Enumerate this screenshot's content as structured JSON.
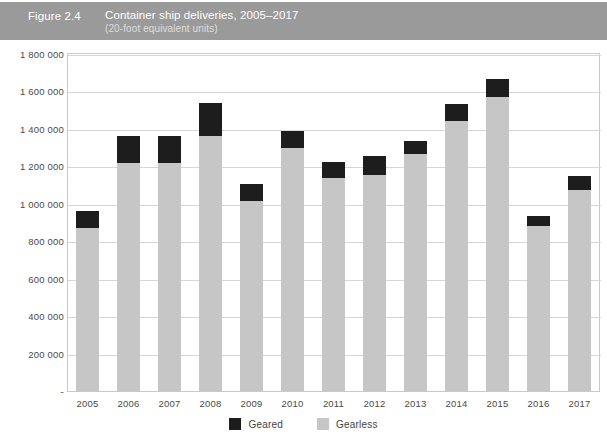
{
  "header": {
    "figure_number": "Figure 2.4",
    "title": "Container ship deliveries, 2005–2017",
    "subtitle": "(20-foot equivalent units)",
    "band_color": "#9a9a9a"
  },
  "legend": {
    "position": "bottom-center",
    "items": [
      {
        "label": "Geared",
        "color": "#1d1d1d",
        "swatch_name": "legend-swatch-geared"
      },
      {
        "label": "Gearless",
        "color": "#c6c6c6",
        "swatch_name": "legend-swatch-gearless"
      }
    ]
  },
  "axis": {
    "y_tick_labels": [
      "1 800 000",
      "1 600 000",
      "1 400 000",
      "1 200 000",
      "1 000 000",
      "800 000",
      "600 000",
      "400 000",
      "200 000",
      "-"
    ],
    "y_tick_values": [
      1800000,
      1600000,
      1400000,
      1200000,
      1000000,
      800000,
      600000,
      400000,
      200000,
      0
    ],
    "grid": true,
    "grid_color": "#d6d6d6",
    "frame_color": "#c9c9c9"
  },
  "chart_data": {
    "type": "bar",
    "stacked": true,
    "title": "Container ship deliveries, 2005–2017",
    "subtitle": "(20-foot equivalent units)",
    "xlabel": "",
    "ylabel": "",
    "ylim": [
      0,
      1800000
    ],
    "ytick_step": 200000,
    "grid": true,
    "legend_position": "bottom-center",
    "categories": [
      "2005",
      "2006",
      "2007",
      "2008",
      "2009",
      "2010",
      "2011",
      "2012",
      "2013",
      "2014",
      "2015",
      "2016",
      "2017"
    ],
    "series": [
      {
        "name": "Gearless",
        "color": "#c6c6c6",
        "values": [
          870000,
          1216000,
          1216000,
          1360000,
          1013000,
          1296000,
          1136000,
          1152000,
          1264000,
          1440000,
          1568000,
          880000,
          1072000
        ]
      },
      {
        "name": "Geared",
        "color": "#1d1d1d",
        "values": [
          90000,
          144000,
          144000,
          181000,
          91000,
          91000,
          85000,
          101000,
          69000,
          91000,
          101000,
          53000,
          75000
        ]
      }
    ],
    "totals": [
      960000,
      1360000,
      1360000,
      1541000,
      1104000,
      1387000,
      1221000,
      1253000,
      1333000,
      1531000,
      1669000,
      933000,
      1147000
    ]
  }
}
